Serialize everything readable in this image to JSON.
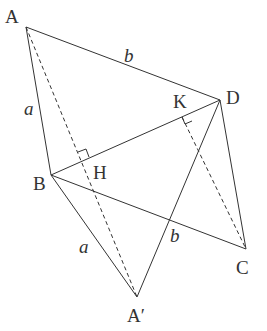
{
  "diagram": {
    "points": {
      "A": "A",
      "B": "B",
      "C": "C",
      "D": "D",
      "A_prime": "A′",
      "H": "H",
      "K": "K"
    },
    "lengths": {
      "AB": "a",
      "AD": "b",
      "A_prime_B": "a",
      "A_prime_D": "b"
    },
    "segments": [
      {
        "from": "A",
        "to": "B",
        "style": "solid"
      },
      {
        "from": "A",
        "to": "D",
        "style": "solid"
      },
      {
        "from": "B",
        "to": "D",
        "style": "solid"
      },
      {
        "from": "B",
        "to": "C",
        "style": "solid"
      },
      {
        "from": "D",
        "to": "C",
        "style": "solid"
      },
      {
        "from": "B",
        "to": "A′",
        "style": "solid"
      },
      {
        "from": "D",
        "to": "A′",
        "style": "solid"
      },
      {
        "from": "A",
        "to": "A′",
        "style": "dashed",
        "through": "H"
      },
      {
        "from": "K",
        "to": "C",
        "style": "dashed"
      }
    ],
    "right_angles": [
      "H",
      "K"
    ]
  }
}
